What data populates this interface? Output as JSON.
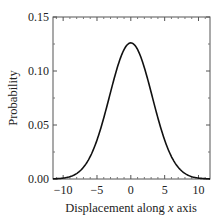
{
  "chart_data": {
    "type": "line",
    "title": "",
    "xlabel": "Displacement along x axis",
    "xlabel_parts": [
      "Displacement along ",
      "x",
      " axis"
    ],
    "ylabel": "Probability",
    "xlim": [
      -11.5,
      11.7
    ],
    "ylim": [
      0,
      0.15
    ],
    "xticks": [
      -10,
      -5,
      0,
      5,
      10
    ],
    "xtick_labels": [
      "−10",
      "−5",
      "0",
      "5",
      "10"
    ],
    "yticks": [
      0,
      0.05,
      0.1,
      0.15
    ],
    "ytick_labels": [
      "0.00",
      "0.05",
      "0.10",
      "0.15"
    ],
    "grid": false,
    "legend": null,
    "series": [
      {
        "name": "Gaussian distribution",
        "mean": 0,
        "sigma": 3.16,
        "peak": 0.126,
        "color": "#111111",
        "x": [
          -11.5,
          -10,
          -9,
          -8,
          -7,
          -6,
          -5,
          -4,
          -3,
          -2,
          -1,
          0,
          1,
          2,
          3,
          4,
          5,
          6,
          7,
          8,
          9,
          10,
          11.5
        ],
        "values": [
          0.0002,
          0.0008,
          0.0022,
          0.005,
          0.011,
          0.0208,
          0.0362,
          0.0566,
          0.08,
          0.103,
          0.1199,
          0.1262,
          0.1199,
          0.103,
          0.08,
          0.0566,
          0.0362,
          0.0208,
          0.011,
          0.005,
          0.0022,
          0.0008,
          0.0002
        ]
      }
    ]
  }
}
